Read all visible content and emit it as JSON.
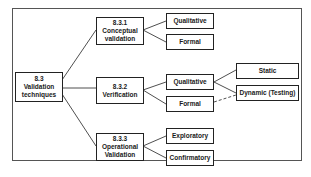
{
  "diagram": {
    "root": {
      "id": "8.3",
      "lines": [
        "8.3",
        "Validation",
        "techniques"
      ]
    },
    "branches": [
      {
        "id": "8.3.1",
        "lines": [
          "8.3.1",
          "Conceptual",
          "validation"
        ],
        "children": [
          "Qualitative",
          "Formal"
        ]
      },
      {
        "id": "8.3.2",
        "lines": [
          "8.3.2",
          "Verification"
        ],
        "children": [
          "Qualitative",
          "Formal"
        ]
      },
      {
        "id": "8.3.3",
        "lines": [
          "8.3.3",
          "Operational",
          "Validation"
        ],
        "children": [
          "Exploratory",
          "Confirmatory"
        ]
      }
    ],
    "leaves": [
      "Static",
      "Dynamic (Testing)"
    ],
    "edges": [
      {
        "from": "8.3",
        "to": "8.3.1"
      },
      {
        "from": "8.3",
        "to": "8.3.2"
      },
      {
        "from": "8.3",
        "to": "8.3.3"
      },
      {
        "from": "8.3.1",
        "to": "Qualitative"
      },
      {
        "from": "8.3.1",
        "to": "Formal"
      },
      {
        "from": "8.3.2",
        "to": "Qualitative"
      },
      {
        "from": "8.3.2",
        "to": "Formal"
      },
      {
        "from": "8.3.3",
        "to": "Exploratory"
      },
      {
        "from": "8.3.3",
        "to": "Confirmatory"
      },
      {
        "from": "Qualitative (8.3.2)",
        "to": "Static"
      },
      {
        "from": "Qualitative (8.3.2)",
        "to": "Dynamic (Testing)"
      },
      {
        "from": "Formal (8.3.2)",
        "to": "Dynamic (Testing)",
        "style": "dashed"
      }
    ]
  }
}
